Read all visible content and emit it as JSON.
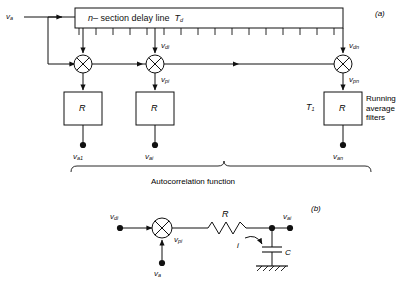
{
  "figure": {
    "panel_a_id": "(a)",
    "panel_b_id": "(b)"
  },
  "panel_a": {
    "input_label": "v",
    "input_sub": "a",
    "delay_line": {
      "text_prefix": "n",
      "text_main": "– section delay line",
      "symbol": "T",
      "symbol_sub": "d",
      "taps": 16
    },
    "multipliers": [
      {
        "name": "multiplier-1",
        "tap_label": "",
        "tap_sub": "",
        "out_label": "",
        "out_sub": ""
      },
      {
        "name": "multiplier-i",
        "tap_label": "v",
        "tap_sub": "di",
        "out_label": "v",
        "out_sub": "pi"
      },
      {
        "name": "multiplier-n",
        "tap_label": "v",
        "tap_sub": "dn",
        "out_label": "v",
        "out_sub": "pn"
      }
    ],
    "filters": [
      {
        "box_label": "R",
        "side_label": "",
        "out_label": "v",
        "out_sub": "a1"
      },
      {
        "box_label": "R",
        "side_label": "",
        "out_label": "v",
        "out_sub": "ai"
      },
      {
        "box_label": "R",
        "side_label": "T",
        "side_sub": "1",
        "out_label": "v",
        "out_sub": "an"
      }
    ],
    "running_average_text": "Running\naverage\nfilters",
    "running_average_lines": [
      "Running",
      "average",
      "filters"
    ],
    "brace_caption": "Autocorrelation function"
  },
  "panel_b": {
    "input_label": "v",
    "input_sub": "di",
    "second_input_label": "v",
    "second_input_sub": "a",
    "product_label": "v",
    "product_sub": "pi",
    "resistor_label": "R",
    "capacitor_label": "C",
    "current_label": "i",
    "output_label": "v",
    "output_sub": "ai"
  },
  "colors": {
    "line": "#111111",
    "background": "#ffffff",
    "text": "#111111"
  }
}
